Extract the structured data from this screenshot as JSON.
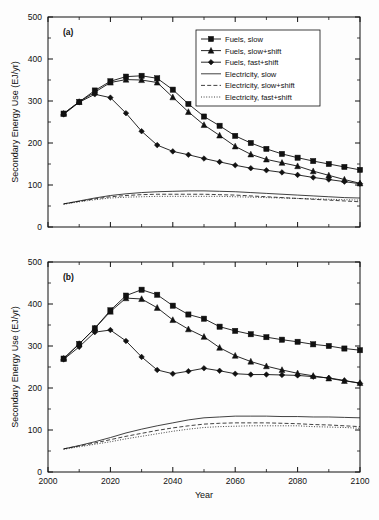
{
  "figure": {
    "title": "",
    "xlabel": "Year",
    "ylabel": "Secondary Energy Use (EJ/yr)",
    "panel_a_label": "(a)",
    "panel_b_label": "(b)",
    "xticklabels": [
      "2000",
      "2020",
      "2040",
      "2060",
      "2080",
      "2100"
    ],
    "yticklabels": [
      "0",
      "100",
      "200",
      "300",
      "400",
      "500"
    ],
    "legend": [
      {
        "label": "Fuels, slow",
        "marker": "square",
        "linestyle": "solid"
      },
      {
        "label": "Fuels, slow+shift",
        "marker": "triangle",
        "linestyle": "solid"
      },
      {
        "label": "Fuels, fast+shift",
        "marker": "diamond",
        "linestyle": "solid"
      },
      {
        "label": "Electricity, slow",
        "marker": "none",
        "linestyle": "solid"
      },
      {
        "label": "Electricity, slow+shift",
        "marker": "none",
        "linestyle": "dashed"
      },
      {
        "label": "Electricity, fast+shift",
        "marker": "none",
        "linestyle": "dotted"
      }
    ]
  },
  "chart_data": [
    {
      "type": "line",
      "panel": "(a)",
      "title": "",
      "xlabel": "Year",
      "ylabel": "Secondary Energy Use (EJ/yr)",
      "xlim": [
        2000,
        2100
      ],
      "ylim": [
        0,
        500
      ],
      "xticks": [
        2000,
        2020,
        2040,
        2060,
        2080,
        2100
      ],
      "yticks": [
        0,
        100,
        200,
        300,
        400,
        500
      ],
      "xminor": 10,
      "yminor": 50,
      "grid": false,
      "legend_position": "upper right",
      "x": [
        2005,
        2010,
        2015,
        2020,
        2025,
        2030,
        2035,
        2040,
        2045,
        2050,
        2055,
        2060,
        2065,
        2070,
        2075,
        2080,
        2085,
        2090,
        2095,
        2100
      ],
      "series": [
        {
          "name": "Fuels, slow",
          "marker": "square",
          "linestyle": "solid",
          "values": [
            270,
            298,
            325,
            347,
            358,
            360,
            354,
            327,
            293,
            263,
            241,
            217,
            200,
            186,
            174,
            165,
            157,
            150,
            143,
            136
          ]
        },
        {
          "name": "Fuels, slow+shift",
          "marker": "triangle",
          "linestyle": "solid",
          "values": [
            270,
            298,
            321,
            344,
            351,
            350,
            344,
            309,
            274,
            243,
            218,
            192,
            173,
            161,
            153,
            145,
            133,
            123,
            113,
            104
          ]
        },
        {
          "name": "Fuels, fast+shift",
          "marker": "diamond",
          "linestyle": "solid",
          "values": [
            268,
            297,
            316,
            308,
            271,
            228,
            195,
            180,
            172,
            163,
            155,
            147,
            140,
            135,
            130,
            124,
            118,
            113,
            108,
            103
          ]
        },
        {
          "name": "Electricity, slow",
          "marker": "none",
          "linestyle": "solid",
          "values": [
            55,
            62,
            69,
            75,
            79,
            82,
            84,
            85,
            86,
            86,
            85,
            84,
            82,
            80,
            78,
            76,
            74,
            72,
            70,
            69
          ]
        },
        {
          "name": "Electricity, slow+shift",
          "marker": "none",
          "linestyle": "dashed",
          "values": [
            55,
            61,
            67,
            72,
            75,
            77,
            78,
            78,
            78,
            78,
            77,
            76,
            74,
            72,
            70,
            68,
            66,
            64,
            62,
            60
          ]
        },
        {
          "name": "Electricity, fast+shift",
          "marker": "none",
          "linestyle": "dotted",
          "values": [
            54,
            60,
            65,
            69,
            71,
            72,
            73,
            73,
            73,
            73,
            73,
            72,
            71,
            70,
            69,
            68,
            67,
            66,
            65,
            64
          ]
        }
      ]
    },
    {
      "type": "line",
      "panel": "(b)",
      "title": "",
      "xlabel": "Year",
      "ylabel": "Secondary Energy Use (EJ/yr)",
      "xlim": [
        2000,
        2100
      ],
      "ylim": [
        0,
        500
      ],
      "xticks": [
        2000,
        2020,
        2040,
        2060,
        2080,
        2100
      ],
      "yticks": [
        0,
        100,
        200,
        300,
        400,
        500
      ],
      "xminor": 10,
      "yminor": 50,
      "grid": false,
      "legend_position": "none",
      "x": [
        2005,
        2010,
        2015,
        2020,
        2025,
        2030,
        2035,
        2040,
        2045,
        2050,
        2055,
        2060,
        2065,
        2070,
        2075,
        2080,
        2085,
        2090,
        2095,
        2100
      ],
      "series": [
        {
          "name": "Fuels, slow",
          "marker": "square",
          "linestyle": "solid",
          "values": [
            270,
            305,
            342,
            385,
            420,
            434,
            422,
            396,
            375,
            365,
            346,
            336,
            328,
            321,
            315,
            310,
            304,
            300,
            294,
            290
          ]
        },
        {
          "name": "Fuels, slow+shift",
          "marker": "triangle",
          "linestyle": "solid",
          "values": [
            270,
            305,
            342,
            382,
            414,
            412,
            391,
            362,
            340,
            322,
            296,
            277,
            263,
            252,
            243,
            235,
            229,
            223,
            217,
            212
          ]
        },
        {
          "name": "Fuels, fast+shift",
          "marker": "diamond",
          "linestyle": "solid",
          "values": [
            268,
            298,
            333,
            338,
            312,
            274,
            243,
            234,
            240,
            247,
            241,
            234,
            232,
            232,
            231,
            230,
            227,
            224,
            218,
            211
          ]
        },
        {
          "name": "Electricity, slow",
          "marker": "none",
          "linestyle": "solid",
          "values": [
            55,
            63,
            72,
            82,
            93,
            102,
            110,
            117,
            124,
            129,
            131,
            133,
            133,
            133,
            132,
            132,
            131,
            131,
            130,
            129
          ]
        },
        {
          "name": "Electricity, slow+shift",
          "marker": "none",
          "linestyle": "dashed",
          "values": [
            55,
            62,
            69,
            77,
            85,
            92,
            99,
            105,
            110,
            114,
            116,
            117,
            117,
            117,
            116,
            115,
            113,
            112,
            110,
            108
          ]
        },
        {
          "name": "Electricity, fast+shift",
          "marker": "none",
          "linestyle": "dotted",
          "values": [
            54,
            60,
            66,
            72,
            79,
            85,
            91,
            97,
            102,
            106,
            108,
            109,
            110,
            110,
            110,
            110,
            108,
            107,
            106,
            104
          ]
        }
      ]
    }
  ]
}
